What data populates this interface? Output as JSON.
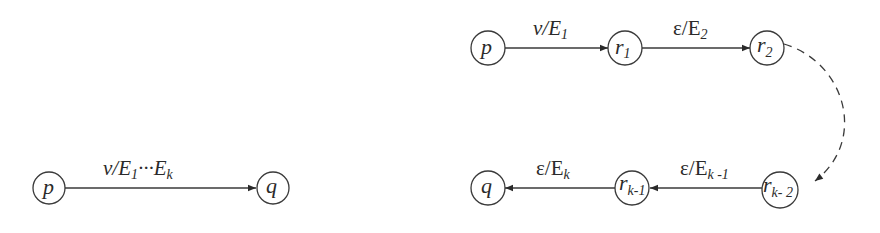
{
  "diagram": {
    "left": {
      "nodes": [
        {
          "id": "p",
          "label": "p"
        },
        {
          "id": "q",
          "label": "q"
        }
      ],
      "edges": [
        {
          "from": "p",
          "to": "q",
          "label_main": "v/E",
          "label_sub1": "1",
          "label_mid": "···E",
          "label_sub2": "k"
        }
      ]
    },
    "right": {
      "nodes": [
        {
          "id": "p",
          "label": "p"
        },
        {
          "id": "r1",
          "label": "r",
          "sub": "1"
        },
        {
          "id": "r2",
          "label": "r",
          "sub": "2"
        },
        {
          "id": "rk-2",
          "label": "r",
          "sub": "k- 2"
        },
        {
          "id": "rk-1",
          "label": "r",
          "sub": "k-1"
        },
        {
          "id": "q",
          "label": "q"
        }
      ],
      "edges": [
        {
          "from": "p",
          "to": "r1",
          "label_main": "v/E",
          "label_sub": "1",
          "style": "solid"
        },
        {
          "from": "r1",
          "to": "r2",
          "label_main": "ε/E",
          "label_sub": "2",
          "style": "solid"
        },
        {
          "from": "r2",
          "to": "rk-2",
          "label_main": "",
          "style": "dashed"
        },
        {
          "from": "rk-2",
          "to": "rk-1",
          "label_main": "ε/E",
          "label_sub": "k -1",
          "style": "solid"
        },
        {
          "from": "rk-1",
          "to": "q",
          "label_main": "ε/E",
          "label_sub": "k",
          "style": "solid"
        }
      ]
    }
  }
}
